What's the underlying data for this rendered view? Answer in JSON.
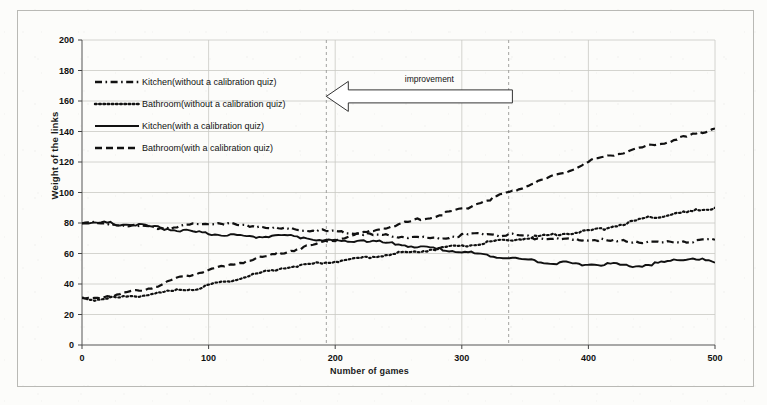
{
  "chart_data": {
    "type": "line",
    "title": "",
    "xlabel": "Number of  games",
    "ylabel": "Weight of  the links",
    "xlim": [
      0,
      500
    ],
    "ylim": [
      0,
      200
    ],
    "xticks": [
      0,
      100,
      200,
      300,
      400,
      500
    ],
    "yticks": [
      0,
      20,
      40,
      60,
      80,
      100,
      120,
      140,
      160,
      180,
      200
    ],
    "grid": true,
    "legend_position": "upper-left-inside",
    "annotations": [
      {
        "text": "improvement",
        "type": "block-arrow-left",
        "arrow_from_x": 340,
        "arrow_to_x": 193,
        "arrow_y": 163
      }
    ],
    "reference_lines": [
      {
        "type": "vertical-dashed",
        "x": 193
      },
      {
        "type": "vertical-dashed",
        "x": 337
      }
    ],
    "series": [
      {
        "name": "Kitchen(without a calibration quiz)",
        "style": "dash-dot",
        "color": "#111111",
        "x": [
          0,
          10,
          20,
          30,
          40,
          50,
          60,
          70,
          80,
          90,
          100,
          110,
          120,
          130,
          140,
          150,
          160,
          170,
          180,
          190,
          200,
          210,
          220,
          230,
          240,
          250,
          260,
          270,
          280,
          290,
          300,
          310,
          320,
          330,
          340,
          350,
          360,
          370,
          380,
          390,
          400,
          410,
          420,
          430,
          440,
          450,
          460,
          470,
          480,
          490,
          500
        ],
        "y": [
          80,
          80,
          79,
          79,
          78,
          78,
          77,
          77,
          78,
          79,
          80,
          80,
          79,
          78,
          78,
          77,
          76,
          76,
          75,
          75,
          74,
          74,
          73,
          72,
          72,
          71,
          71,
          70,
          70,
          71,
          72,
          73,
          73,
          72,
          72,
          71,
          70,
          70,
          69,
          69,
          69,
          69,
          68,
          68,
          68,
          67,
          67,
          68,
          68,
          69,
          69
        ]
      },
      {
        "name": "Bathroom(without a calibration quiz)",
        "style": "dotted",
        "color": "#111111",
        "x": [
          0,
          10,
          20,
          30,
          40,
          50,
          60,
          70,
          80,
          90,
          100,
          110,
          120,
          130,
          140,
          150,
          160,
          170,
          180,
          190,
          200,
          210,
          220,
          230,
          240,
          250,
          260,
          270,
          280,
          290,
          300,
          310,
          320,
          330,
          340,
          350,
          360,
          370,
          380,
          390,
          400,
          410,
          420,
          430,
          440,
          450,
          460,
          470,
          480,
          490,
          500
        ],
        "y": [
          30,
          30,
          31,
          31,
          32,
          33,
          34,
          35,
          36,
          37,
          39,
          41,
          43,
          45,
          47,
          49,
          51,
          52,
          53,
          54,
          55,
          56,
          57,
          58,
          59,
          60,
          61,
          62,
          63,
          64,
          65,
          66,
          67,
          68,
          69,
          70,
          71,
          72,
          73,
          74,
          75,
          76,
          78,
          80,
          82,
          84,
          85,
          86,
          87,
          89,
          90
        ]
      },
      {
        "name": "Kitchen(with a calibration quiz)",
        "style": "solid",
        "color": "#111111",
        "x": [
          0,
          10,
          20,
          30,
          40,
          50,
          60,
          70,
          80,
          90,
          100,
          110,
          120,
          130,
          140,
          150,
          160,
          170,
          180,
          190,
          200,
          210,
          220,
          230,
          240,
          250,
          260,
          270,
          280,
          290,
          300,
          310,
          320,
          330,
          340,
          350,
          360,
          370,
          380,
          390,
          400,
          410,
          420,
          430,
          440,
          450,
          460,
          470,
          480,
          490,
          500
        ],
        "y": [
          80,
          80,
          80,
          79,
          79,
          78,
          77,
          76,
          75,
          74,
          73,
          72,
          72,
          71,
          71,
          72,
          72,
          71,
          70,
          69,
          68,
          68,
          69,
          68,
          67,
          66,
          65,
          64,
          63,
          62,
          61,
          60,
          59,
          58,
          57,
          56,
          55,
          54,
          54,
          53,
          53,
          53,
          53,
          52,
          52,
          53,
          54,
          56,
          57,
          56,
          54
        ]
      },
      {
        "name": "Bathroom(with a calibration quiz)",
        "style": "dashed",
        "color": "#111111",
        "x": [
          0,
          10,
          20,
          30,
          40,
          50,
          60,
          70,
          80,
          90,
          100,
          110,
          120,
          130,
          140,
          150,
          160,
          170,
          180,
          190,
          200,
          210,
          220,
          230,
          240,
          250,
          260,
          270,
          280,
          290,
          300,
          310,
          320,
          330,
          340,
          350,
          360,
          370,
          380,
          390,
          400,
          410,
          420,
          430,
          440,
          450,
          460,
          470,
          480,
          490,
          500
        ],
        "y": [
          30,
          31,
          32,
          33,
          35,
          37,
          39,
          42,
          45,
          47,
          49,
          51,
          53,
          55,
          57,
          59,
          61,
          63,
          65,
          67,
          69,
          71,
          73,
          75,
          77,
          79,
          81,
          83,
          85,
          87,
          89,
          92,
          95,
          98,
          101,
          104,
          107,
          110,
          113,
          116,
          120,
          123,
          125,
          127,
          129,
          131,
          133,
          135,
          137,
          140,
          142
        ]
      }
    ],
    "legend_entries": [
      {
        "label": "Kitchen(without a calibration quiz)",
        "style": "dash-dot"
      },
      {
        "label": "Bathroom(without a calibration quiz)",
        "style": "dotted"
      },
      {
        "label": "Kitchen(with a calibration quiz)",
        "style": "solid"
      },
      {
        "label": "Bathroom(with a calibration quiz)",
        "style": "dashed"
      }
    ]
  }
}
